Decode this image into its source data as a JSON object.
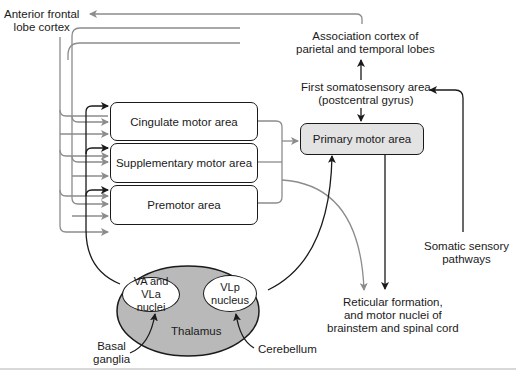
{
  "diagram": {
    "type": "motor-control-pathways",
    "colors": {
      "dark_line": "#1a1a1a",
      "gray_line": "#8c8c8c",
      "thalamus_fill": "#b9b9b9",
      "primary_fill": "#e3e3e3"
    },
    "labels": {
      "anterior_frontal": [
        "Anterior frontal",
        "lobe cortex"
      ],
      "association": [
        "Association cortex of",
        "parietal and temporal lobes"
      ],
      "somatosensory": [
        "First somatosensory area",
        "(postcentral gyrus)"
      ],
      "somatic_pathways": [
        "Somatic sensory",
        "pathways"
      ],
      "reticular": [
        "Reticular formation,",
        "and motor nuclei of",
        "brainstem and spinal cord"
      ],
      "basal_ganglia": [
        "Basal",
        "ganglia"
      ],
      "cerebellum": "Cerebellum",
      "thalamus": "Thalamus"
    },
    "boxes": {
      "cingulate": "Cingulate motor area",
      "supplementary": "Supplementary motor area",
      "premotor": "Premotor area",
      "primary": "Primary motor area"
    },
    "nuclei": {
      "va_vla": [
        "VA and VLa",
        "nuclei"
      ],
      "vlp": [
        "VLp",
        "nucleus"
      ]
    }
  }
}
